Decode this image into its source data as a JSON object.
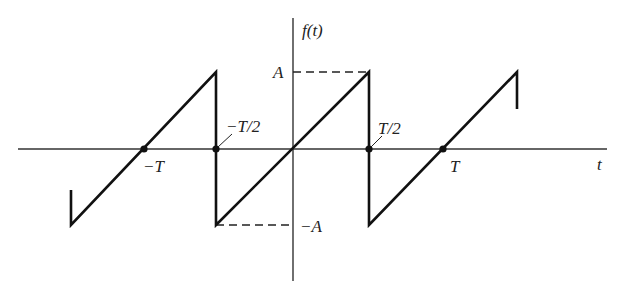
{
  "figure": {
    "type": "sawtooth-wave",
    "function_label": "f(t)",
    "x_axis_label": "t",
    "amplitude_label": "A",
    "neg_amplitude_label": "−A",
    "tick_labels": {
      "neg_T": "−T",
      "neg_half_T": "−T/2",
      "half_T": "T/2",
      "T": "T"
    },
    "colors": {
      "curve": "#111111",
      "axis": "#333333",
      "dashed": "#222222"
    }
  }
}
